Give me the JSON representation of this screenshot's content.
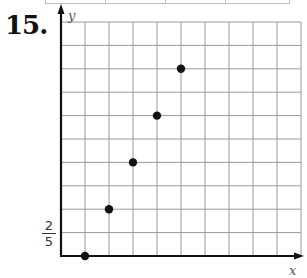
{
  "problem": {
    "number": "15."
  },
  "axes": {
    "x_label": "x",
    "y_label": "y",
    "y_tick_label": {
      "numerator": "2",
      "denominator": "5"
    }
  },
  "colors": {
    "grid": "#9a9a9a",
    "axis": "#111111",
    "point": "#111111"
  },
  "chart_data": {
    "type": "scatter",
    "title": "",
    "xlabel": "x",
    "ylabel": "y",
    "grid": true,
    "x_grid_lines": 10,
    "y_grid_lines": 10,
    "y_unit": "2/5",
    "xlim": [
      0,
      10
    ],
    "ylim": [
      0,
      10
    ],
    "points_grid_units": [
      {
        "x": 1,
        "y": 0
      },
      {
        "x": 2,
        "y": 2
      },
      {
        "x": 3,
        "y": 4
      },
      {
        "x": 4,
        "y": 6
      },
      {
        "x": 5,
        "y": 8
      }
    ],
    "points_y_values": [
      0,
      0.8,
      1.6,
      2.4,
      3.2
    ],
    "annotations": [
      "y-axis tick at first gridline labeled 2/5"
    ]
  }
}
